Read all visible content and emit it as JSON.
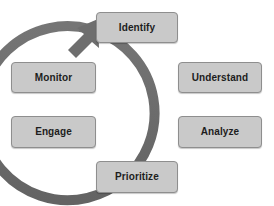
{
  "diagram": {
    "type": "circular-process-cycle",
    "title": "",
    "direction": "clockwise",
    "colors": {
      "background": "#ffffff",
      "node_fill": "#c9c9c9",
      "node_border": "#8e8e8e",
      "node_text": "#1d1d1d",
      "arrow": "#6b6b6b"
    },
    "arrow": {
      "name": "clockwise-cycle-arrow",
      "center_x": 137,
      "center_y": 103,
      "radius": 87,
      "stroke_width": 10,
      "arrowhead_position": "top-left",
      "arrowhead_points_to": "Identify"
    },
    "nodes": [
      {
        "id": "identify",
        "label": "Identify",
        "position": "top",
        "order": 1
      },
      {
        "id": "understand",
        "label": "Understand",
        "position": "upper-right",
        "order": 2
      },
      {
        "id": "analyze",
        "label": "Analyze",
        "position": "lower-right",
        "order": 3
      },
      {
        "id": "prioritize",
        "label": "Prioritize",
        "position": "bottom",
        "order": 4
      },
      {
        "id": "engage",
        "label": "Engage",
        "position": "lower-left",
        "order": 5
      },
      {
        "id": "monitor",
        "label": "Monitor",
        "position": "upper-left",
        "order": 6
      }
    ]
  }
}
